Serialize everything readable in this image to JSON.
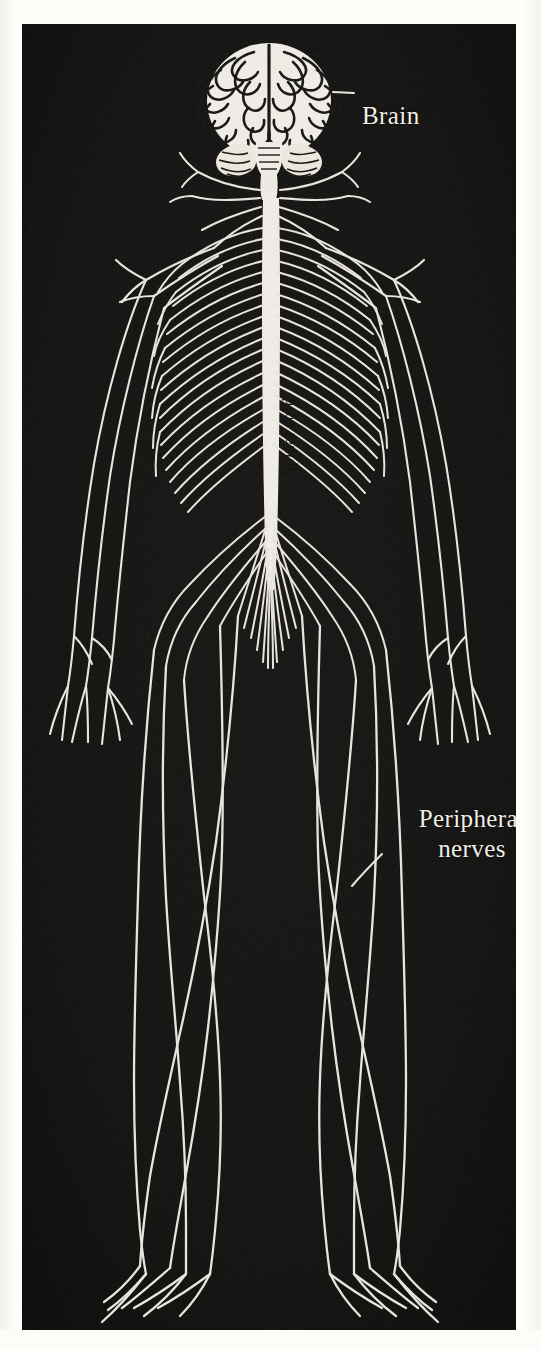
{
  "figure": {
    "background_color": "#0e0d0c",
    "nerve_color": "#e9e7dd",
    "paper_color": "#fdfcf8",
    "label_color": "#f1efe8"
  },
  "labels": {
    "brain": "Brain",
    "spinal_cord": "Spinal cord",
    "peripheral_line1": "Peripheral",
    "peripheral_line2": "nerves"
  },
  "parts": {
    "brain_name": "brain",
    "cerebellum_name": "cerebellum",
    "brainstem_name": "brainstem",
    "spinal_cord_name": "spinal-cord",
    "cauda_equina_name": "cauda-equina",
    "intercostal_nerves_name": "intercostal-nerves",
    "brachial_plexus_name": "brachial-plexus",
    "arm_nerves_name": "arm-nerves",
    "hand_nerves_name": "hand-nerves",
    "leg_nerves_name": "leg-nerves",
    "foot_nerves_name": "foot-nerves"
  }
}
